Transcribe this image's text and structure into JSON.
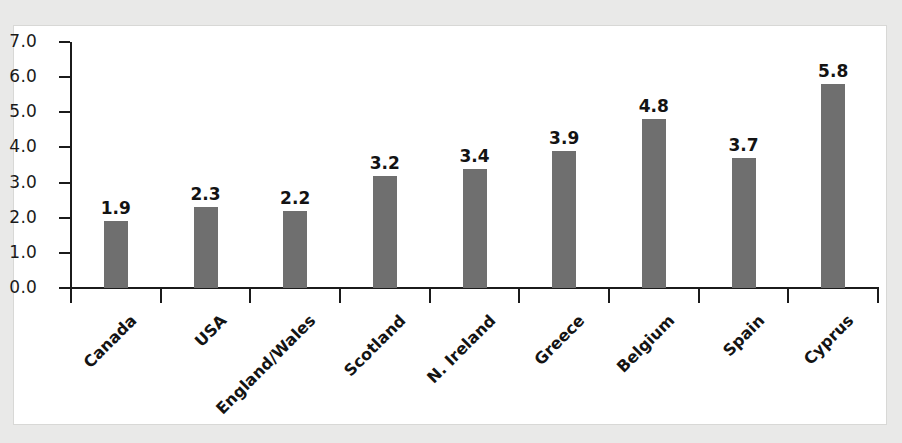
{
  "chart_data": {
    "type": "bar",
    "title": "",
    "subtitle": "",
    "xlabel": "",
    "ylabel": "",
    "categories": [
      "Canada",
      "USA",
      "England/Wales",
      "Scotland",
      "N. Ireland",
      "Greece",
      "Belgium",
      "Spain",
      "Cyprus"
    ],
    "values": [
      1.9,
      2.3,
      2.2,
      3.2,
      3.4,
      3.9,
      4.8,
      3.7,
      5.8
    ],
    "value_labels": [
      "1.9",
      "2.3",
      "2.2",
      "3.2",
      "3.4",
      "3.9",
      "4.8",
      "3.7",
      "5.8"
    ],
    "ylim": [
      0.0,
      7.0
    ],
    "ytick_labels": [
      "7.0",
      "6.0",
      "5.0",
      "4.0",
      "3.0",
      "2.0",
      "1.0",
      "0.0"
    ],
    "ytick_values": [
      7.0,
      6.0,
      5.0,
      4.0,
      3.0,
      2.0,
      1.0,
      0.0
    ],
    "grid": false,
    "legend": null,
    "bar_color": "#6f6f6f",
    "axis_color": "#1b1b1b",
    "panel_color": "#ffffff",
    "page_background": "#e9e9e8",
    "series": [
      {
        "name": "",
        "values": [
          1.9,
          2.3,
          2.2,
          3.2,
          3.4,
          3.9,
          4.8,
          3.7,
          5.8
        ]
      }
    ]
  }
}
